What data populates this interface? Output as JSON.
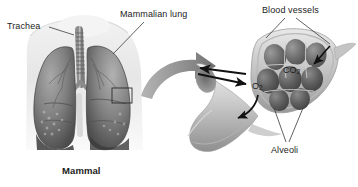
{
  "figure": {
    "background_color": "#ffffff",
    "width": 358,
    "height": 187,
    "style": "grayscale anatomical illustration"
  },
  "left_panel": {
    "name": "mammal-lung-illustration",
    "caption": "Mammal",
    "labels": {
      "trachea": "Trachea",
      "mammalian_lung": "Mammalian lung"
    },
    "callout_box": "inset region on right lung"
  },
  "transition": {
    "arrow": "large curved gray magnification arrow pointing right"
  },
  "right_panel": {
    "name": "alveoli-detail-illustration",
    "labels": {
      "blood_vessels": "Blood vessels",
      "alveoli": "Alveoli"
    },
    "gases": {
      "carbon_dioxide": "CO",
      "carbon_dioxide_sub": "2",
      "oxygen": "O",
      "oxygen_sub": "2"
    },
    "flow_arrows": [
      "black arrow into bronchiole (inhaled air)",
      "black arrow out of bronchiole (exhaled air)",
      "curved arrow to CO2",
      "curved arrow from O2"
    ]
  },
  "colors": {
    "ink": "#1c1c1c",
    "leader_line": "#3a3a3a",
    "tissue_dark": "#4a4a4a",
    "tissue_mid": "#8d8d8d",
    "tissue_light": "#c9c9c9",
    "arrow_gray": "#8a8a8a",
    "arrow_black": "#111111"
  }
}
